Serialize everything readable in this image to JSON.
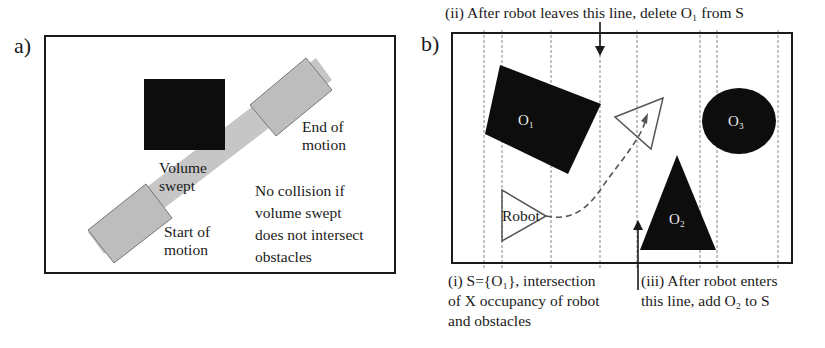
{
  "panel_a": {
    "label": "a)",
    "end_of_motion": [
      "End of",
      "motion"
    ],
    "volume_swept": [
      "Volume",
      "swept"
    ],
    "start_of_motion": [
      "Start of",
      "motion"
    ],
    "no_collision_note": [
      "No collision if",
      "volume swept",
      "does not intersect",
      "obstacles"
    ]
  },
  "panel_b": {
    "label": "b)",
    "callout_ii": "(ii) After robot leaves this line, delete O₁ from S",
    "callout_i": [
      "(i) S={O₁}, intersection",
      "of X occupancy of robot",
      "and obstacles"
    ],
    "callout_iii": [
      "(iii) After robot enters",
      "this line, add O₂ to S"
    ],
    "obstacles": [
      {
        "id": "O1",
        "label": "O₁",
        "shape": "rotated-square"
      },
      {
        "id": "O2",
        "label": "O₂",
        "shape": "triangle"
      },
      {
        "id": "O3",
        "label": "O₃",
        "shape": "circle"
      }
    ],
    "robot_label": "Robot"
  },
  "colors": {
    "obstacle": "#0d0d0d",
    "swept_volume": "#c4c4c4",
    "robot_outline": "#555555",
    "frame": "#1a1a1a",
    "sweep_lines": "#9a9a9a"
  }
}
